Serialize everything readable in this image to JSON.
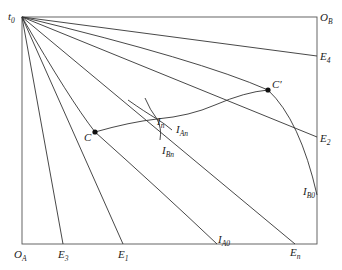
{
  "diagram": {
    "type": "edgeworth-box",
    "origins": {
      "t0": {
        "base": "t",
        "sub": "0"
      },
      "OB": {
        "base": "O",
        "sub": "B"
      },
      "OA": {
        "base": "O",
        "sub": "A"
      }
    },
    "endpoints": {
      "E4": {
        "base": "E",
        "sub": "4"
      },
      "E2": {
        "base": "E",
        "sub": "2"
      },
      "E3": {
        "base": "E",
        "sub": "3"
      },
      "E1": {
        "base": "E",
        "sub": "1"
      },
      "En": {
        "base": "E",
        "sub": "n"
      }
    },
    "curves": {
      "IB0": {
        "base": "I",
        "sub": "B0"
      },
      "IA0": {
        "base": "I",
        "sub": "A0"
      },
      "IAn": {
        "base": "I",
        "sub": "An"
      },
      "IBn": {
        "base": "I",
        "sub": "Bn"
      }
    },
    "points": {
      "C": {
        "label": "C"
      },
      "Cprime": {
        "label": "C′"
      },
      "In": {
        "base": "I",
        "sub": "n"
      }
    }
  }
}
